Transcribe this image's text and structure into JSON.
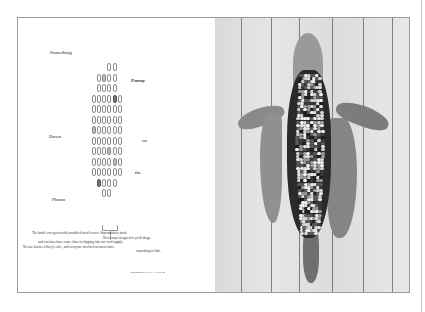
{
  "article": {
    "title_words": [
      {
        "text": "Something",
        "style": "normal",
        "x": 49,
        "y": 49
      },
      {
        "text": "Funny",
        "style": "italic",
        "x": 130,
        "y": 77
      },
      {
        "text": "Down",
        "style": "normal",
        "x": 48,
        "y": 133
      },
      {
        "text": "on",
        "style": "normal",
        "x": 141,
        "y": 137
      },
      {
        "text": "the",
        "style": "normal",
        "x": 134,
        "y": 169
      },
      {
        "text": "Pharm",
        "style": "normal",
        "x": 51,
        "y": 196
      }
    ],
    "caption_lines": [
      {
        "text": "The battle over genetically modified food is over: Supermarkets stock",
        "x": 31,
        "y": 230
      },
      {
        "text": "Now crops designed to yield drugs",
        "x": 102,
        "y": 234.5
      },
      {
        "text": "and vaccines have come close to slipping into our food supply.",
        "x": 37,
        "y": 239
      },
      {
        "text": "No one knows if they're safe, and everyone involved seems to have",
        "x": 22,
        "y": 243.5
      },
      {
        "text": "something to hide.",
        "x": 135,
        "y": 248
      }
    ],
    "byline": "Photograph by HOLLY LINDEM",
    "credit": "Photograph by"
  },
  "diagram": {
    "name": "corn-kernel-grid",
    "rows": [
      {
        "cols": [
          1,
          2
        ],
        "offset": 1
      },
      {
        "cols": [
          0,
          1,
          2,
          3
        ],
        "shaded": {
          "1": "mid"
        }
      },
      {
        "cols": [
          0,
          1,
          2,
          3
        ]
      },
      {
        "cols": [
          0,
          1,
          2,
          3,
          4,
          5
        ],
        "offset": -1,
        "shaded": {
          "4": "dark"
        }
      },
      {
        "cols": [
          0,
          1,
          2,
          3,
          4,
          5
        ],
        "offset": -1
      },
      {
        "cols": [
          0,
          1,
          2,
          3,
          4,
          5
        ],
        "offset": -1
      },
      {
        "cols": [
          0,
          1,
          2,
          3,
          4,
          5
        ],
        "offset": -1,
        "shaded": {
          "0": "mid"
        }
      },
      {
        "cols": [
          0,
          1,
          2,
          3,
          4,
          5
        ],
        "offset": -1
      },
      {
        "cols": [
          0,
          1,
          2,
          3,
          4,
          5
        ],
        "offset": -1,
        "shaded": {
          "3": "mid"
        }
      },
      {
        "cols": [
          0,
          1,
          2,
          3,
          4,
          5
        ],
        "offset": -1,
        "shaded": {
          "4": "mid"
        }
      },
      {
        "cols": [
          0,
          1,
          2,
          3,
          4,
          5
        ],
        "offset": -1
      },
      {
        "cols": [
          0,
          1,
          2,
          3
        ],
        "shaded": {
          "0": "dark"
        }
      },
      {
        "cols": [
          1,
          2
        ],
        "offset": 0
      }
    ]
  },
  "photo": {
    "subject": "ear of multicolored corn with peeled husk on white wooden planks",
    "plank_lines_x": [
      26,
      56,
      84,
      117,
      148,
      177
    ]
  }
}
